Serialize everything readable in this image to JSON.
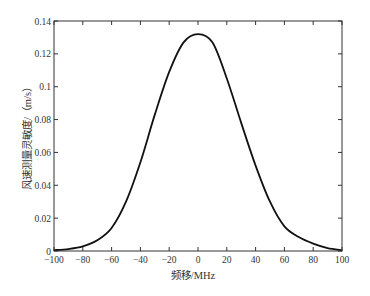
{
  "chart_data": {
    "type": "line",
    "title": "",
    "xlabel": "频移/MHz",
    "ylabel": "风速测量灵敏度/（m/s）",
    "xlim": [
      -100,
      100
    ],
    "ylim": [
      0,
      0.14
    ],
    "xticks": [
      -100,
      -80,
      -60,
      -40,
      -20,
      0,
      20,
      40,
      60,
      80,
      100
    ],
    "yticks": [
      0,
      0.02,
      0.04,
      0.06,
      0.08,
      0.1,
      0.12,
      0.14
    ],
    "ytick_labels": [
      "0",
      "0.02",
      "0.04",
      "0.06",
      "0.08",
      "0.1",
      "0.12",
      "0.14"
    ],
    "grid": false,
    "legend": null,
    "series": [
      {
        "name": "sensitivity",
        "color": "#111111",
        "x": [
          -100,
          -90,
          -80,
          -70,
          -60,
          -50,
          -40,
          -30,
          -20,
          -10,
          0,
          10,
          20,
          30,
          40,
          50,
          60,
          70,
          80,
          90,
          100
        ],
        "y": [
          0.0005,
          0.0012,
          0.0028,
          0.0065,
          0.014,
          0.03,
          0.054,
          0.083,
          0.109,
          0.127,
          0.132,
          0.127,
          0.105,
          0.078,
          0.052,
          0.03,
          0.015,
          0.0085,
          0.0045,
          0.0018,
          0.0005
        ]
      }
    ]
  },
  "layout": {
    "plot_left": 54,
    "plot_top": 21,
    "plot_right": 342,
    "plot_bottom": 251
  }
}
